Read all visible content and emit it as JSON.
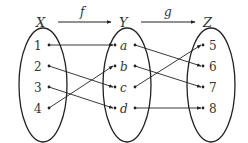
{
  "diagram": {
    "type": "function-mapping",
    "colors": {
      "stroke": "#222222",
      "text": "#333333",
      "background": "#ffffff"
    },
    "sets": [
      {
        "name": "X",
        "elements": [
          "1",
          "2",
          "3",
          "4"
        ]
      },
      {
        "name": "Y",
        "elements": [
          "a",
          "b",
          "c",
          "d"
        ]
      },
      {
        "name": "Z",
        "elements": [
          "5",
          "6",
          "7",
          "8"
        ]
      }
    ],
    "functions": [
      {
        "name": "f",
        "from": "X",
        "to": "Y",
        "mapping": [
          [
            "1",
            "a"
          ],
          [
            "2",
            "c"
          ],
          [
            "3",
            "d"
          ],
          [
            "4",
            "b"
          ]
        ]
      },
      {
        "name": "g",
        "from": "Y",
        "to": "Z",
        "mapping": [
          [
            "a",
            "6"
          ],
          [
            "b",
            "7"
          ],
          [
            "c",
            "5"
          ],
          [
            "d",
            "8"
          ]
        ]
      }
    ]
  }
}
